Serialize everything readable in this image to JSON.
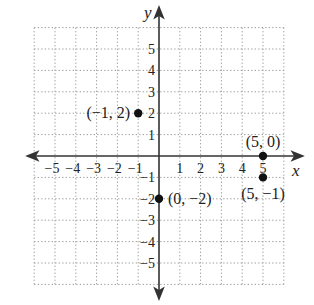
{
  "chart_data": {
    "type": "scatter",
    "title": "",
    "xlabel": "x",
    "ylabel": "y",
    "xlim": [
      -6,
      6
    ],
    "ylim": [
      -6,
      6
    ],
    "grid": true,
    "grid_style": "dotted",
    "x_ticks": [
      -5,
      -4,
      -3,
      -2,
      -1,
      1,
      2,
      3,
      4,
      5
    ],
    "y_ticks": [
      -5,
      -4,
      -3,
      -2,
      -1,
      1,
      2,
      3,
      4,
      5
    ],
    "x_tick_labels": [
      "−5",
      "−4",
      "−3",
      "−2",
      "−1",
      "1",
      "2",
      "3",
      "4",
      "5"
    ],
    "y_tick_labels": [
      "−5",
      "−4",
      "−3",
      "−2",
      "−1",
      "1",
      "2",
      "3",
      "4",
      "5"
    ],
    "points": [
      {
        "x": -1,
        "y": 2,
        "label": "(−1, 2)"
      },
      {
        "x": 5,
        "y": 0,
        "label": "(5, 0)"
      },
      {
        "x": 0,
        "y": -2,
        "label": "(0, −2)"
      },
      {
        "x": 5,
        "y": -1,
        "label": "(5, −1)"
      }
    ],
    "colors": {
      "axis": "#333333",
      "grid": "#9a9a9a",
      "point": "#111111",
      "text": "#222222"
    }
  },
  "layout": {
    "origin_px": [
      159,
      156
    ],
    "unit_px_x": 20.8,
    "unit_px_y": 21.4
  }
}
